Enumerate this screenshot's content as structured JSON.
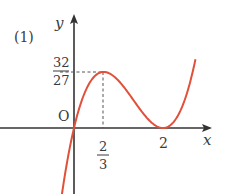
{
  "problem_label": "(1)",
  "axes": {
    "x_label": "x",
    "y_label": "y",
    "origin_label": "O"
  },
  "annotations": {
    "max_y": {
      "numerator": "32",
      "denominator": "27"
    },
    "max_x": {
      "numerator": "2",
      "denominator": "3"
    },
    "root_x": "2"
  },
  "colors": {
    "curve": "#e0503a",
    "axis": "#333333",
    "guide": "#555555"
  },
  "chart_data": {
    "type": "line",
    "title": "",
    "function": "y = x(x-2)^2",
    "xlabel": "x",
    "ylabel": "y",
    "key_points": [
      {
        "x": 0,
        "y": 0,
        "label": "O"
      },
      {
        "x": 0.667,
        "y": 1.185,
        "label": "local max (2/3, 32/27)"
      },
      {
        "x": 2,
        "y": 0,
        "label": "local min / root (2, 0)"
      }
    ],
    "x_ticks": [
      "2/3",
      "2"
    ],
    "y_ticks": [
      "32/27"
    ],
    "grid": false
  }
}
